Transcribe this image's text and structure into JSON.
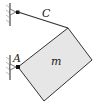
{
  "diagram": {
    "labels": {
      "cable": "C",
      "pin": "A",
      "mass": "m"
    },
    "colors": {
      "plate_fill": "#e6e6e6",
      "line": "#333333",
      "wall": "#555555"
    }
  }
}
